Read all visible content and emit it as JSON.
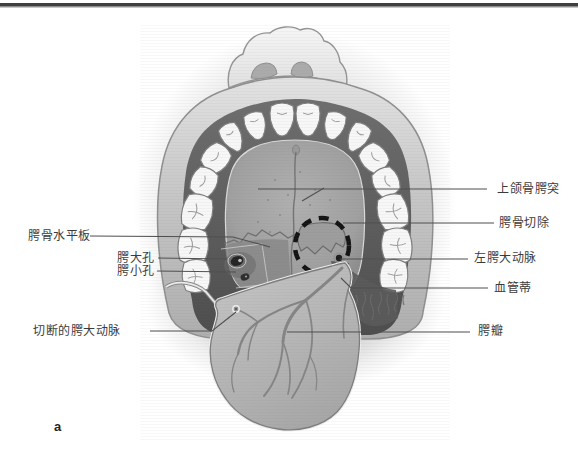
{
  "figure": {
    "marker": "a",
    "labels": {
      "left": [
        {
          "text": "腭骨水平板"
        },
        {
          "text": "腭大孔"
        },
        {
          "text": "腭小孔"
        },
        {
          "text": "切断的腭大动脉"
        }
      ],
      "right": [
        {
          "text": "上颌骨腭突"
        },
        {
          "text": "腭骨切除"
        },
        {
          "text": "左腭大动脉"
        },
        {
          "text": "血管蒂"
        },
        {
          "text": "腭瓣"
        }
      ]
    },
    "palette": {
      "background": "#ffffff",
      "top_rule": "#4a4a4a",
      "leader_line": "#4f4f4f",
      "label_text": "#3b3b3b",
      "dashed_outline": "#141414"
    }
  }
}
